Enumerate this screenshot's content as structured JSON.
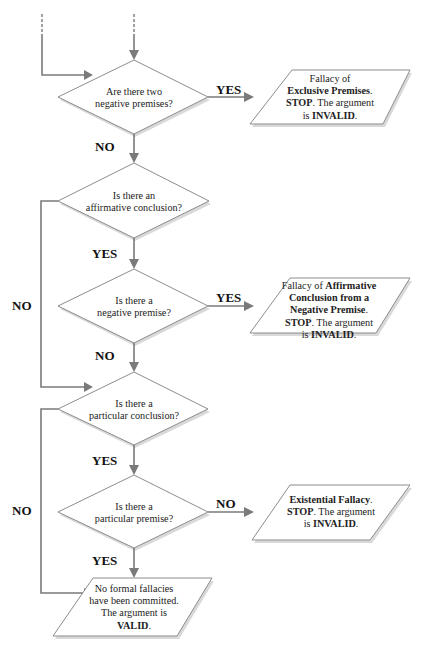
{
  "diagram": {
    "type": "flowchart",
    "decisions": [
      {
        "id": "d1",
        "line1": "Are there two",
        "line2": "negative premises?"
      },
      {
        "id": "d2",
        "line1": "Is there an",
        "line2": "affirmative conclusion?"
      },
      {
        "id": "d3",
        "line1": "Is there a",
        "line2": "negative premise?"
      },
      {
        "id": "d4",
        "line1": "Is there a",
        "line2": "particular conclusion?"
      },
      {
        "id": "d5",
        "line1": "Is there a",
        "line2": "particular premise?"
      }
    ],
    "outcomes": [
      {
        "id": "o1",
        "l1_plain": "Fallacy of",
        "l2_bold": "Exclusive Premises",
        "l2_plain": ".",
        "l3_bold": "STOP",
        "l3_plain": ". The argument",
        "l4_plain": "is ",
        "l4_bold": "INVALID",
        "l4_end": "."
      },
      {
        "id": "o2",
        "l1_plain": "Fallacy of ",
        "l1_bold": "Affirmative",
        "l2_bold": "Conclusion from a",
        "l3_bold": "Negative Premise",
        "l3_plain": ".",
        "l4_bold": "STOP",
        "l4_plain": ". The argument",
        "l5_plain": "is ",
        "l5_bold": "INVALID",
        "l5_end": "."
      },
      {
        "id": "o3",
        "l1_bold": "Existential Fallacy",
        "l1_plain": ".",
        "l2_bold": "STOP",
        "l2_plain": ". The argument",
        "l3_plain": "is ",
        "l3_bold": "INVALID",
        "l3_end": "."
      },
      {
        "id": "o4",
        "l1_plain": "No formal fallacies",
        "l2_plain": "have been committed.",
        "l3_plain": "The argument is",
        "l4_bold": "VALID",
        "l4_end": "."
      }
    ],
    "edge_labels": {
      "d1_yes": "YES",
      "d1_no": "NO",
      "d2_yes": "YES",
      "d2_no": "NO",
      "d3_yes": "YES",
      "d3_no": "NO",
      "d4_yes": "YES",
      "d4_no": "NO",
      "d5_yes": "YES",
      "d5_no": "NO"
    },
    "colors": {
      "line": "#7a7a7a",
      "shape_stroke": "#8c8c8c",
      "shape_fill": "#ffffff",
      "text": "#222222"
    }
  }
}
